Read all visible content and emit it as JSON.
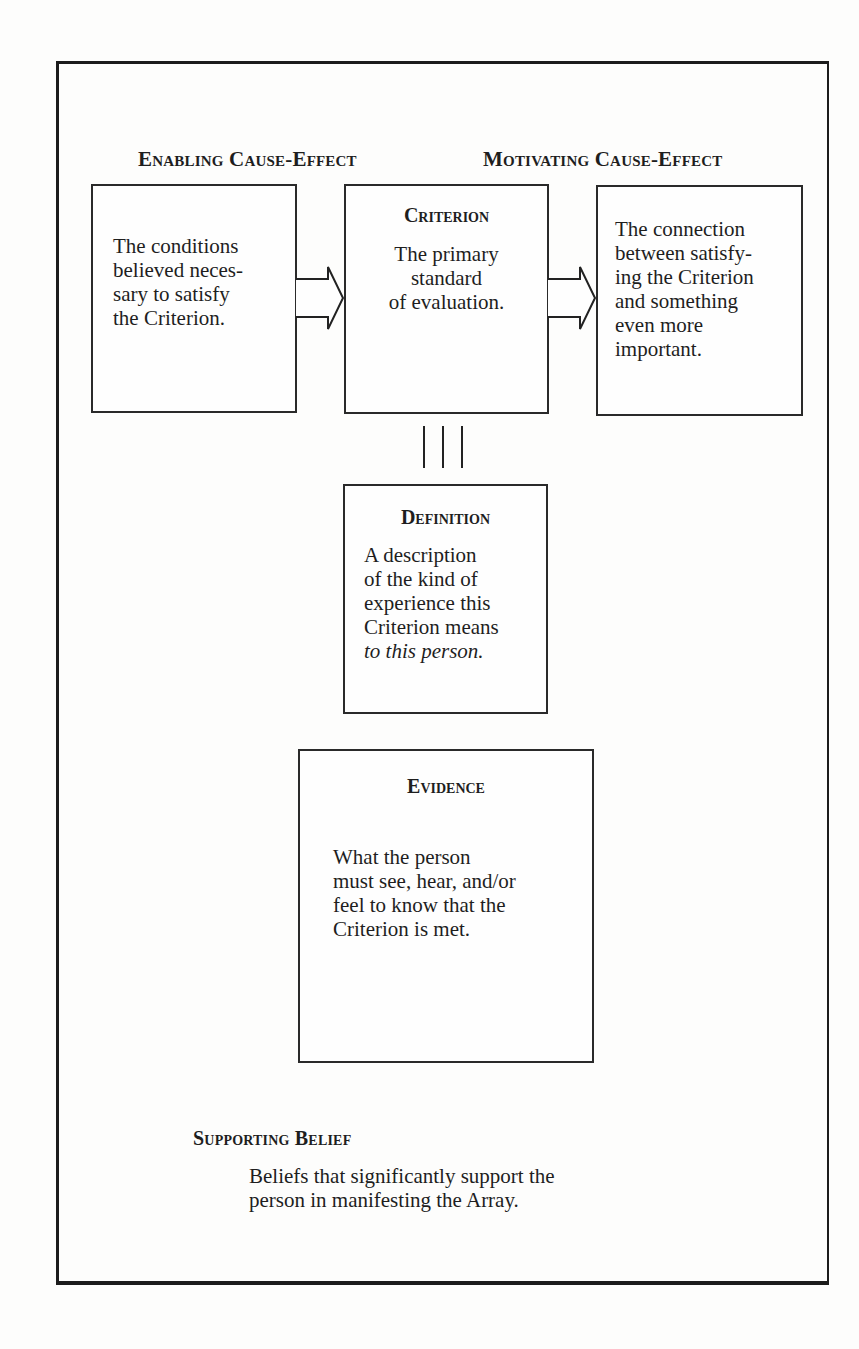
{
  "diagram": {
    "headings": {
      "enabling": "Enabling Cause-Effect",
      "motivating": "Motivating Cause-Effect"
    },
    "enabling_box": {
      "lines": [
        "The conditions",
        "believed neces-",
        "sary to satisfy",
        "the Criterion."
      ]
    },
    "criterion_box": {
      "title": "Criterion",
      "lines": [
        "The primary",
        "standard",
        "of evaluation."
      ]
    },
    "motivating_box": {
      "lines": [
        "The connection",
        "between satisfy-",
        "ing the Criterion",
        "and something",
        "even more",
        "important."
      ]
    },
    "equivalence_symbol": "triple-bar",
    "definition_box": {
      "title": "Definition",
      "lines": [
        "A description",
        "of the kind of",
        "experience this",
        "Criterion means"
      ],
      "italic_line": "to this person."
    },
    "evidence_box": {
      "title": "Evidence",
      "lines": [
        "What the person",
        "must see, hear, and/or",
        "feel to know that the",
        "Criterion is met."
      ]
    },
    "supporting_belief": {
      "heading": "Supporting Belief",
      "lines": [
        "Beliefs that significantly support the",
        "person in manifesting the Array."
      ]
    },
    "arrows": [
      {
        "from": "enabling_box",
        "to": "criterion_box",
        "icon": "hollow-right-arrow"
      },
      {
        "from": "criterion_box",
        "to": "motivating_box",
        "icon": "hollow-right-arrow"
      }
    ],
    "colors": {
      "ink": "#1e1e1e",
      "background": "#fdfdfc"
    }
  }
}
